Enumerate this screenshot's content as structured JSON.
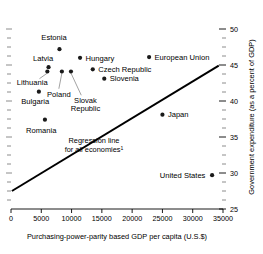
{
  "chart_data": {
    "type": "scatter",
    "title": "",
    "xlabel": "Purchasing-power-parity based GDP per capita (U.S.$)",
    "ylabel": "Government expenditure (as a percent of GDP)",
    "xlim": [
      0,
      35000
    ],
    "ylim": [
      25,
      50
    ],
    "grid": false,
    "legend": "none",
    "x_ticks": [
      0,
      5000,
      10000,
      15000,
      20000,
      25000,
      30000,
      35000
    ],
    "x_tick_labels": [
      "0",
      "5000",
      "10000",
      "15000",
      "20000",
      "25000",
      "30000",
      "35000"
    ],
    "y_ticks": [
      25,
      30,
      35,
      40,
      45,
      50
    ],
    "y_tick_labels": [
      "25",
      "30",
      "35",
      "40",
      "45",
      "50"
    ],
    "y_minor_ticks": [
      26.25,
      27.5,
      28.75,
      31.25,
      32.5,
      33.75,
      36.25,
      37.5,
      38.75,
      41.25,
      42.5,
      43.75,
      46.25,
      47.5,
      48.75
    ],
    "points": [
      {
        "name": "Estonia",
        "x": 8000,
        "y": 47.2,
        "label": "Estonia",
        "label_x": 7100,
        "label_y": 48.9,
        "anchor": "middle",
        "leader": false
      },
      {
        "name": "Hungary",
        "x": 11400,
        "y": 46.0,
        "label": "Hungary",
        "label_x": 12300,
        "label_y": 46.0,
        "anchor": "start",
        "leader": false
      },
      {
        "name": "European University",
        "x": 22800,
        "y": 46.1,
        "label": "European Union",
        "label_x": 23700,
        "label_y": 46.1,
        "anchor": "start",
        "leader": false
      },
      {
        "name": "Latvia",
        "x": 6200,
        "y": 44.7,
        "label": "Latvia",
        "label_x": 5300,
        "label_y": 45.9,
        "anchor": "middle",
        "leader": false
      },
      {
        "name": "Czech Republic",
        "x": 13500,
        "y": 44.4,
        "label": "Czech Republic",
        "label_x": 14400,
        "label_y": 44.4,
        "anchor": "start",
        "leader": false
      },
      {
        "name": "Lithuania",
        "x": 6000,
        "y": 44.1,
        "label": "Lithuania",
        "label_x": 3500,
        "label_y": 42.6,
        "anchor": "middle",
        "leader": true,
        "leader_x": 4700,
        "leader_y": 43.1
      },
      {
        "name": "Poland",
        "x": 8400,
        "y": 44.1,
        "label": "Poland",
        "label_x": 7900,
        "label_y": 41.0,
        "anchor": "middle",
        "leader": true,
        "leader_x": 7900,
        "leader_y": 41.7
      },
      {
        "name": "Slovak Republic",
        "x": 9900,
        "y": 44.1,
        "label": "Slovak",
        "label_x": 12300,
        "label_y": 40.1,
        "anchor": "middle",
        "leader": true,
        "leader_x": 11600,
        "leader_y": 40.8
      },
      {
        "name": "Slovenia",
        "x": 15400,
        "y": 43.1,
        "label": "Slovenia",
        "label_x": 16300,
        "label_y": 43.1,
        "anchor": "start",
        "leader": false
      },
      {
        "name": "Bulgaria",
        "x": 4600,
        "y": 41.3,
        "label": "Bulgaria",
        "label_x": 4000,
        "label_y": 39.9,
        "anchor": "middle",
        "leader": false
      },
      {
        "name": "Japan",
        "x": 25000,
        "y": 38.1,
        "label": "Japan",
        "label_x": 25900,
        "label_y": 38.1,
        "anchor": "start",
        "leader": false
      },
      {
        "name": "Romania",
        "x": 5600,
        "y": 37.4,
        "label": "Romania",
        "label_x": 5000,
        "label_y": 36.0,
        "anchor": "middle",
        "leader": false
      },
      {
        "name": "United States",
        "x": 33200,
        "y": 29.7,
        "label": "United States",
        "label_x": 32100,
        "label_y": 29.7,
        "anchor": "end",
        "leader": false
      }
    ],
    "extra_labels": [
      {
        "name": "slovak-republic-line2",
        "text": "Republic",
        "x": 12300,
        "y": 39.0,
        "anchor": "middle"
      }
    ],
    "regression_line": {
      "label_line1": "Regression line",
      "label_line2": "for all economies",
      "footnote_marker": "1",
      "x_start": 150,
      "y_start": 27.5,
      "x_end": 34300,
      "y_end": 44.9,
      "label_x": 13700,
      "label_y": 34.1
    },
    "colors": {
      "marker": "#1a1a1a",
      "line": "#000000",
      "text": "#000000",
      "background": "#ffffff"
    }
  }
}
